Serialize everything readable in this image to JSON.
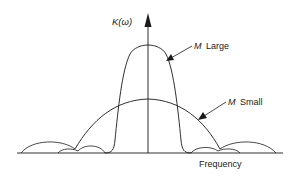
{
  "figure": {
    "y_axis_label": "K(ω)",
    "x_axis_label": "Frequency",
    "curves": [
      {
        "name": "M Large",
        "label_var": "M",
        "label_word": "Large",
        "description": "narrow tall main lobe with small side lobes"
      },
      {
        "name": "M Small",
        "label_var": "M",
        "label_word": "Small",
        "description": "wide low main lobe with larger side lobes"
      }
    ],
    "colors": {
      "line": "#1a1a1a",
      "background": "#ffffff"
    }
  }
}
